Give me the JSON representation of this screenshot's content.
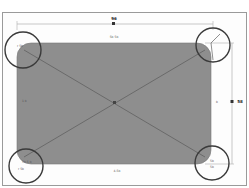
{
  "drawing": {
    "shape": "rounded-rectangle",
    "fill_color": "#8e8e8e",
    "callout_circle_color": "#3a3a3a",
    "dimension_line_color": "#b0b0b0",
    "diagonal_color": "#5a5a5a",
    "width_dimension": {
      "label": "96"
    },
    "height_dimension": {
      "label": "58"
    },
    "top_inner_label": "5b 5b",
    "bottom_inner_label": "4-5b",
    "corner_labels": {
      "top_left": "r 5b",
      "top_right": "",
      "bottom_left_primary": "5b 5 b",
      "bottom_left_secondary": "r 5b",
      "bottom_right_primary": "5b",
      "bottom_right_secondary": "5b"
    },
    "left_side_label": "1 b",
    "right_side_label": "b"
  }
}
